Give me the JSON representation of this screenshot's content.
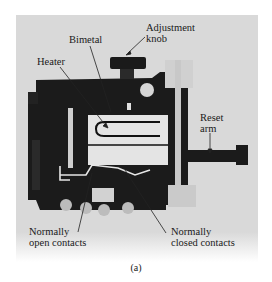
{
  "figure": {
    "caption": "(a)",
    "labels": {
      "adjustment_knob": [
        "Adjustment",
        "knob"
      ],
      "bimetal": "Bimetal",
      "heater": "Heater",
      "reset_arm": [
        "Reset",
        "arm"
      ],
      "normally_open": [
        "Normally",
        "open contacts"
      ],
      "normally_closed": [
        "Normally",
        "closed contacts"
      ]
    }
  }
}
